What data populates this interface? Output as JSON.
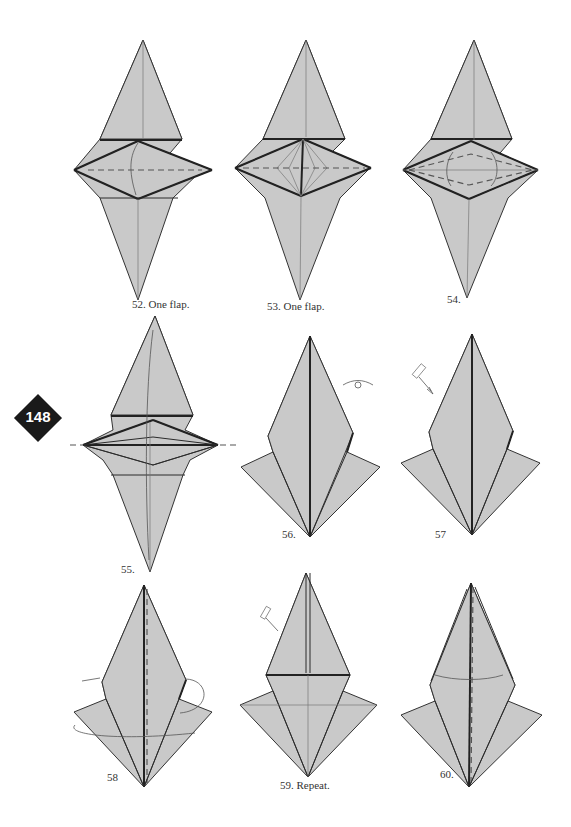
{
  "page": {
    "page_number": "148",
    "background": "#ffffff",
    "paper_color": "#c9c9c9",
    "line_color": "#2b2b2b"
  },
  "steps": [
    {
      "number": "52",
      "caption": "52. One flap.",
      "symbols": [
        "valley-fold-line",
        "fold-arrow"
      ]
    },
    {
      "number": "53",
      "caption": "53. One flap.",
      "symbols": [
        "valley-fold-line",
        "squash-fold-creases"
      ]
    },
    {
      "number": "54",
      "caption": "54.",
      "symbols": [
        "valley-fold-lines",
        "fold-arrows"
      ]
    },
    {
      "number": "55",
      "caption": "55.",
      "symbols": [
        "valley-fold-line",
        "fold-up-arrow"
      ]
    },
    {
      "number": "56",
      "caption": "56.",
      "symbols": [
        "turn-over-arrow"
      ]
    },
    {
      "number": "57",
      "caption": "57",
      "symbols": [
        "repeat-steps-arrow"
      ]
    },
    {
      "number": "58",
      "caption": "58",
      "symbols": [
        "valley-fold-line",
        "wrap-arrow"
      ]
    },
    {
      "number": "59",
      "caption": "59. Repeat.",
      "symbols": [
        "repeat-steps-arrow"
      ]
    },
    {
      "number": "60",
      "caption": "60.",
      "symbols": [
        "valley-fold-line",
        "fold-arrow"
      ]
    }
  ]
}
